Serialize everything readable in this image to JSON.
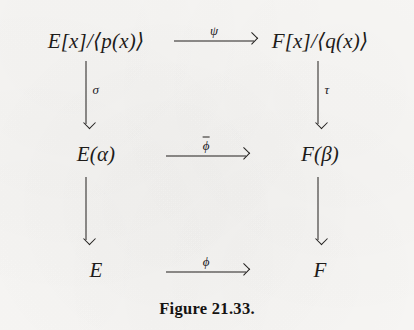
{
  "figure": {
    "caption": "Figure 21.33.",
    "type": "commutative-diagram",
    "background_color": "#f8f7f5",
    "ink_color": "#23211f"
  },
  "diagram": {
    "nodes": [
      {
        "id": "top-left",
        "label": "E[x]/⟨p(x)⟩",
        "row": 1,
        "column": "left"
      },
      {
        "id": "top-right",
        "label": "F[x]/⟨q(x)⟩",
        "row": 1,
        "column": "right"
      },
      {
        "id": "mid-left",
        "label": "E(α)",
        "row": 2,
        "column": "left"
      },
      {
        "id": "mid-right",
        "label": "F(β)",
        "row": 2,
        "column": "right"
      },
      {
        "id": "bottom-left",
        "label": "E",
        "row": 3,
        "column": "left"
      },
      {
        "id": "bottom-right",
        "label": "F",
        "row": 3,
        "column": "right"
      }
    ],
    "horizontal_arrows": [
      {
        "id": "top-morphism",
        "label": "ψ",
        "overline": false,
        "from": "top-left",
        "to": "top-right"
      },
      {
        "id": "middle-morphism",
        "label": "ϕ",
        "overline": true,
        "from": "mid-left",
        "to": "mid-right"
      },
      {
        "id": "bottom-morphism",
        "label": "ϕ",
        "overline": false,
        "from": "bottom-left",
        "to": "bottom-right"
      }
    ],
    "vertical_arrows": [
      {
        "id": "left-upper",
        "label": "σ",
        "from": "top-left",
        "to": "mid-left"
      },
      {
        "id": "right-upper",
        "label": "τ",
        "from": "top-right",
        "to": "mid-right"
      },
      {
        "id": "left-lower",
        "label": "",
        "from": "mid-left",
        "to": "bottom-left"
      },
      {
        "id": "right-lower",
        "label": "",
        "from": "mid-right",
        "to": "bottom-right"
      }
    ]
  }
}
